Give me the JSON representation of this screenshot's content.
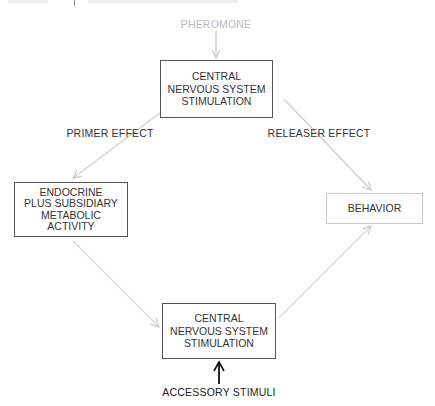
{
  "diagram": {
    "source": {
      "label": "PHEROMONE"
    },
    "nodes": {
      "cns_top": {
        "lines": [
          "CENTRAL",
          "NERVOUS SYSTEM",
          "STIMULATION"
        ]
      },
      "endocrine": {
        "lines": [
          "ENDOCRINE",
          "PLUS SUBSIDIARY",
          "METABOLIC",
          "ACTIVITY"
        ]
      },
      "behavior": {
        "lines": [
          "BEHAVIOR"
        ]
      },
      "cns_bottom": {
        "lines": [
          "CENTRAL",
          "NERVOUS SYSTEM",
          "STIMULATION"
        ]
      },
      "accessory": {
        "label": "ACCESSORY STIMULI"
      }
    },
    "edges": {
      "primer": {
        "label": "PRIMER EFFECT"
      },
      "releaser": {
        "label": "RELEASER EFFECT"
      }
    },
    "colors": {
      "dark_line": "#1a1a1a",
      "light_arrow": "#cfcfcf",
      "box_border": "#555555",
      "text": "#333333"
    }
  }
}
